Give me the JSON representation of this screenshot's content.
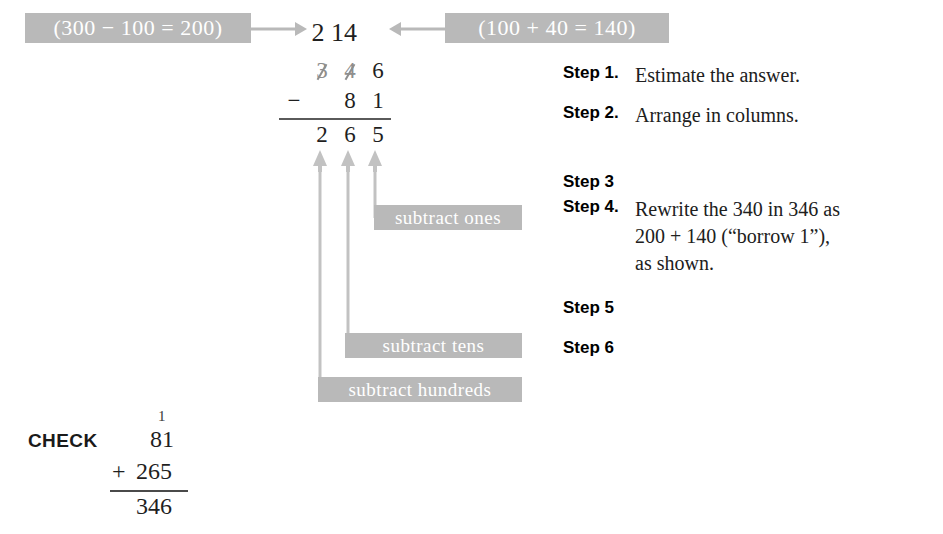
{
  "callouts": {
    "estimate_left": "(300 − 100 = 200)",
    "estimate_right": "(100 + 40 = 140)",
    "subtract_ones": "subtract ones",
    "subtract_tens": "subtract tens",
    "subtract_hundreds": "subtract hundreds"
  },
  "problem": {
    "regroup_hundreds": "2",
    "regroup_tens": "14",
    "minuend": [
      "3",
      "4",
      "6"
    ],
    "operator": "−",
    "subtrahend": [
      "8",
      "1"
    ],
    "difference": [
      "2",
      "6",
      "5"
    ]
  },
  "steps": [
    {
      "label": "Step 1.",
      "text": "Estimate the answer.",
      "cont": []
    },
    {
      "label": "Step 2.",
      "text": "Arrange in columns.",
      "cont": []
    },
    {
      "label": "Step 3",
      "text": "",
      "cont": []
    },
    {
      "label": "Step 4.",
      "text": "Rewrite the 340 in 346 as",
      "cont": [
        "200 + 140 (“borrow 1”),",
        "as shown."
      ]
    },
    {
      "label": "Step 5",
      "text": "",
      "cont": []
    },
    {
      "label": "Step 6",
      "text": "",
      "cont": []
    }
  ],
  "check": {
    "label": "CHECK",
    "carry": "1",
    "addend1": "81",
    "operator": "+",
    "addend2": "265",
    "sum": "346"
  },
  "colors": {
    "callout_background": "#b9b9b9",
    "callout_text": "#ffffff",
    "arrow": "#b9b9b9",
    "ink": "#1f1f1f",
    "regroup_ink": "#8e8e8e"
  }
}
